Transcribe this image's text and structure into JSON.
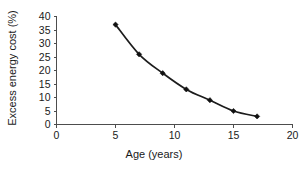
{
  "chart_data": {
    "type": "line",
    "title": "",
    "xlabel": "Age (years)",
    "ylabel": "Excess energy cost (%)",
    "x": [
      5,
      7,
      9,
      11,
      13,
      15,
      17
    ],
    "values": [
      37,
      26,
      19,
      13,
      9,
      5,
      3
    ],
    "series": [
      {
        "name": "Excess energy cost",
        "x": [
          5,
          7,
          9,
          11,
          13,
          15,
          17
        ],
        "values": [
          37,
          26,
          19,
          13,
          9,
          5,
          3
        ]
      }
    ],
    "xlim": [
      0,
      20
    ],
    "ylim": [
      0,
      40
    ],
    "xticks": [
      0,
      5,
      10,
      15,
      20
    ],
    "yticks": [
      0,
      5,
      10,
      15,
      20,
      25,
      30,
      35,
      40
    ],
    "xtick_labels": [
      "0",
      "5",
      "10",
      "15",
      "20"
    ],
    "ytick_labels": [
      "0",
      "5",
      "10",
      "15",
      "20",
      "25",
      "30",
      "35",
      "40"
    ],
    "grid": false,
    "legend": false,
    "marker": "filled-diamond",
    "line_color": "#1c1c1c",
    "marker_color": "#111111",
    "axis_color": "#4d4d4d",
    "background_color": "#ffffff"
  }
}
